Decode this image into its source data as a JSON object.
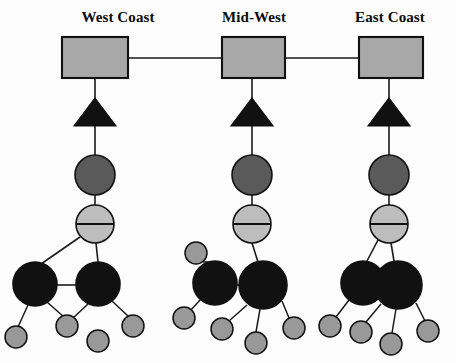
{
  "diagram": {
    "background_color": "#fdfdfd",
    "width": 456,
    "height": 363,
    "colors": {
      "site_box_fill": "#a8a8a8",
      "firewall_fill": "#111111",
      "router_fill": "#5a5a5a",
      "hub_fill": "#bdbdbd",
      "server_fill": "#111111",
      "workstation_fill": "#999999",
      "stroke": "#111111",
      "link": "#1a1a1a"
    },
    "sites": [
      {
        "id": "west-coast",
        "label": "West Coast",
        "label_x": 118,
        "label_y": 22,
        "box": {
          "x": 62,
          "y": 37,
          "width": 66,
          "height": 41
        },
        "firewall": {
          "cx": 95,
          "cy": 125,
          "half_width": 21,
          "height": 42
        },
        "router": {
          "cx": 95,
          "cy": 175,
          "r": 20
        },
        "hub": {
          "cx": 95,
          "cy": 224,
          "r": 19
        },
        "servers": [
          {
            "cx": 35,
            "cy": 284,
            "r": 22
          },
          {
            "cx": 98,
            "cy": 284,
            "r": 22
          }
        ],
        "workstations": [
          {
            "cx": 16,
            "cy": 337,
            "r": 11
          },
          {
            "cx": 67,
            "cy": 326,
            "r": 11
          },
          {
            "cx": 98,
            "cy": 341,
            "r": 11
          },
          {
            "cx": 133,
            "cy": 326,
            "r": 11
          }
        ]
      },
      {
        "id": "mid-west",
        "label": "Mid-West",
        "label_x": 254,
        "label_y": 22,
        "box": {
          "x": 222,
          "y": 37,
          "width": 63,
          "height": 41
        },
        "firewall": {
          "cx": 252,
          "cy": 125,
          "half_width": 21,
          "height": 42
        },
        "router": {
          "cx": 252,
          "cy": 175,
          "r": 20
        },
        "hub": {
          "cx": 252,
          "cy": 224,
          "r": 19
        },
        "servers": [
          {
            "cx": 215,
            "cy": 283,
            "r": 22
          },
          {
            "cx": 263,
            "cy": 285,
            "r": 24
          }
        ],
        "workstations": [
          {
            "cx": 196,
            "cy": 253,
            "r": 11
          },
          {
            "cx": 184,
            "cy": 318,
            "r": 11
          },
          {
            "cx": 222,
            "cy": 329,
            "r": 11
          },
          {
            "cx": 256,
            "cy": 343,
            "r": 11
          },
          {
            "cx": 294,
            "cy": 328,
            "r": 11
          }
        ]
      },
      {
        "id": "east-coast",
        "label": "East Coast",
        "label_x": 390,
        "label_y": 22,
        "box": {
          "x": 359,
          "y": 37,
          "width": 64,
          "height": 41
        },
        "firewall": {
          "cx": 389,
          "cy": 125,
          "half_width": 21,
          "height": 42
        },
        "router": {
          "cx": 389,
          "cy": 175,
          "r": 20
        },
        "hub": {
          "cx": 389,
          "cy": 224,
          "r": 19
        },
        "servers": [
          {
            "cx": 363,
            "cy": 283,
            "r": 22
          },
          {
            "cx": 398,
            "cy": 285,
            "r": 24
          }
        ],
        "workstations": [
          {
            "cx": 330,
            "cy": 326,
            "r": 11
          },
          {
            "cx": 361,
            "cy": 332,
            "r": 11
          },
          {
            "cx": 391,
            "cy": 344,
            "r": 11
          },
          {
            "cx": 428,
            "cy": 331,
            "r": 11
          }
        ]
      }
    ],
    "backbone_links": [
      {
        "from": "west-coast",
        "to": "mid-west",
        "x1": 128,
        "y1": 58,
        "x2": 222,
        "y2": 58
      },
      {
        "from": "mid-west",
        "to": "east-coast",
        "x1": 285,
        "y1": 58,
        "x2": 359,
        "y2": 58
      }
    ],
    "legend_semantics": {
      "gray_rectangle": "wide-area site / WAN cloud",
      "black_triangle": "firewall",
      "dark_gray_circle": "router",
      "light_gray_circle_with_line": "hub / switch",
      "large_black_circle": "server",
      "small_gray_circle": "workstation"
    }
  }
}
